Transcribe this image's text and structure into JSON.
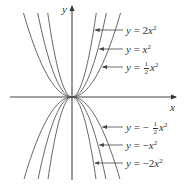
{
  "chart_data": {
    "type": "line",
    "title": "",
    "xlabel": "x",
    "ylabel": "y",
    "axes": {
      "x_visible": true,
      "y_visible": true,
      "ticks": false,
      "grid": false
    },
    "series": [
      {
        "name": "y = 2x^2",
        "label_text": "y = 2x²",
        "coefficient": 2
      },
      {
        "name": "y = x^2",
        "label_text": "y = x²",
        "coefficient": 1
      },
      {
        "name": "y = (1/2)x^2",
        "label_text": "y = ½x²",
        "coefficient": 0.5
      },
      {
        "name": "y = -(1/2)x^2",
        "label_text": "y = −½x²",
        "coefficient": -0.5
      },
      {
        "name": "y = -x^2",
        "label_text": "y = −x²",
        "coefficient": -1
      },
      {
        "name": "y = -2x^2",
        "label_text": "y = −2x²",
        "coefficient": -2
      }
    ],
    "legend_position": "right, arrows pointing to curves"
  },
  "labels": {
    "x_axis": "x",
    "y_axis": "y",
    "upper": [
      {
        "prefix": "y = ",
        "coef": "2",
        "var": "x",
        "exp": "2"
      },
      {
        "prefix": "y = ",
        "coef": "",
        "var": "x",
        "exp": "2"
      },
      {
        "prefix": "y = ",
        "num": "1",
        "den": "2",
        "var": "x",
        "exp": "2"
      }
    ],
    "lower": [
      {
        "prefix": "y = −",
        "num": "1",
        "den": "2",
        "var": "x",
        "exp": "2"
      },
      {
        "prefix": "y = −",
        "coef": "",
        "var": "x",
        "exp": "2"
      },
      {
        "prefix": "y = −",
        "coef": "2",
        "var": "x",
        "exp": "2"
      }
    ]
  },
  "colors": {
    "axis": "#444444",
    "curve": "#555555",
    "text": "#333333"
  }
}
